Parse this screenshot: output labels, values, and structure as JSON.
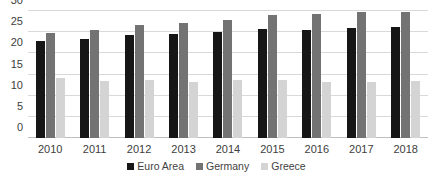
{
  "chart_data": {
    "type": "bar",
    "title": "",
    "subtitle": "",
    "xlabel": "",
    "ylabel": "",
    "ylim": [
      0,
      30
    ],
    "yticks": [
      0,
      5,
      10,
      15,
      20,
      25,
      30
    ],
    "grid": true,
    "legend_position": "bottom",
    "categories": [
      "2010",
      "2011",
      "2012",
      "2013",
      "2014",
      "2015",
      "2016",
      "2017",
      "2018"
    ],
    "series": [
      {
        "name": "Euro Area",
        "color": "#161616",
        "values": [
          22.8,
          23.3,
          24.3,
          24.6,
          25.1,
          25.8,
          25.5,
          25.9,
          26.3
        ]
      },
      {
        "name": "Germany",
        "color": "#737373",
        "values": [
          24.9,
          25.6,
          26.7,
          27.2,
          27.9,
          29.0,
          29.2,
          29.7,
          29.8
        ]
      },
      {
        "name": "Greece",
        "color": "#d4d4d4",
        "values": [
          14.1,
          13.5,
          13.6,
          13.3,
          13.8,
          13.8,
          13.2,
          13.2,
          13.5
        ]
      }
    ]
  }
}
